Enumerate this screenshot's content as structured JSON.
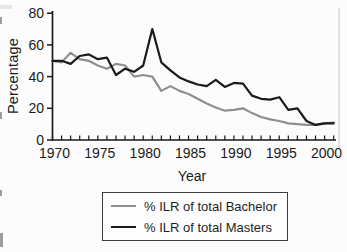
{
  "figure": {
    "background": "#fcfcfc",
    "axis_color": "#1a1a1a"
  },
  "chart_data": {
    "type": "line",
    "title": "",
    "xlabel": "Year",
    "ylabel": "Percentage",
    "ylim": [
      0,
      80
    ],
    "yticks": [
      0,
      20,
      40,
      60,
      80
    ],
    "xticks": [
      1970,
      1975,
      1980,
      1985,
      1990,
      1995,
      2000
    ],
    "grid": false,
    "legend_position": "bottom-boxed",
    "x": [
      1970,
      1971,
      1972,
      1973,
      1974,
      1975,
      1976,
      1977,
      1978,
      1979,
      1980,
      1981,
      1982,
      1983,
      1984,
      1985,
      1986,
      1987,
      1988,
      1989,
      1990,
      1991,
      1992,
      1993,
      1994,
      1995,
      1996,
      1997,
      1998,
      1999,
      2000,
      2001
    ],
    "series": [
      {
        "name": "% ILR of total Bachelor",
        "color": "#8f8f8f",
        "values": [
          50,
          49,
          55,
          51,
          50,
          47,
          45,
          48,
          47,
          40,
          41,
          40,
          31,
          34,
          31,
          29,
          26,
          23,
          20.5,
          18.5,
          19,
          20,
          17,
          14.5,
          13,
          12,
          10.5,
          10,
          9.5,
          9.5,
          10.5,
          11
        ]
      },
      {
        "name": "% ILR of total Masters",
        "color": "#1a1a1a",
        "values": [
          50,
          50,
          48,
          53,
          54,
          51,
          52,
          41,
          45,
          43,
          47,
          70,
          49,
          44,
          39.5,
          37,
          35,
          34,
          38,
          33.5,
          36,
          35.5,
          28,
          26,
          25.5,
          27,
          19,
          20,
          12,
          9.5,
          10.5,
          10.5
        ]
      }
    ]
  }
}
